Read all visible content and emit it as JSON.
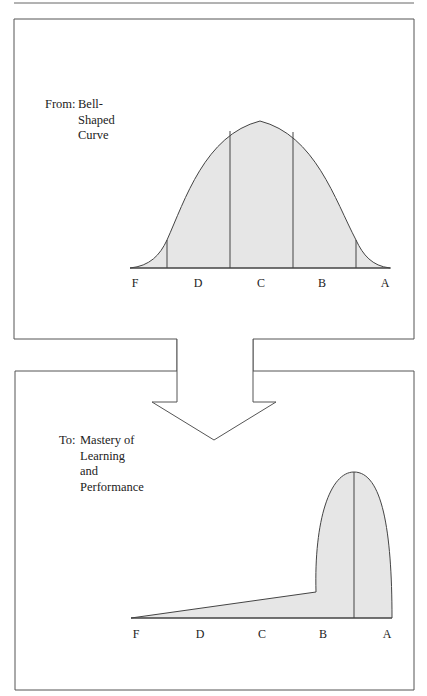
{
  "top_panel": {
    "caption_prefix": "From:",
    "caption_text": "Bell-\nShaped\nCurve",
    "axis_labels": [
      "F",
      "D",
      "C",
      "B",
      "A"
    ]
  },
  "bottom_panel": {
    "caption_prefix": "To:",
    "caption_text": "Mastery of\nLearning and\nPerformance",
    "axis_labels": [
      "F",
      "D",
      "C",
      "B",
      "A"
    ]
  },
  "colors": {
    "fill": "#e6e6e6",
    "stroke": "#444444",
    "frame": "#555555"
  }
}
